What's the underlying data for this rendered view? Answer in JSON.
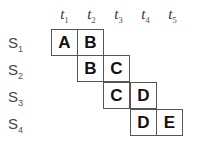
{
  "columns": [
    {
      "base": "t",
      "sub": "1"
    },
    {
      "base": "t",
      "sub": "2"
    },
    {
      "base": "t",
      "sub": "3"
    },
    {
      "base": "t",
      "sub": "4"
    },
    {
      "base": "t",
      "sub": "5"
    }
  ],
  "rows": [
    {
      "base": "S",
      "sub": "1",
      "cells": [
        {
          "col": 0,
          "label": "A"
        },
        {
          "col": 1,
          "label": "B"
        }
      ]
    },
    {
      "base": "S",
      "sub": "2",
      "cells": [
        {
          "col": 1,
          "label": "B"
        },
        {
          "col": 2,
          "label": "C"
        }
      ]
    },
    {
      "base": "S",
      "sub": "3",
      "cells": [
        {
          "col": 2,
          "label": "C"
        },
        {
          "col": 3,
          "label": "D"
        }
      ]
    },
    {
      "base": "S",
      "sub": "4",
      "cells": [
        {
          "col": 3,
          "label": "D"
        },
        {
          "col": 4,
          "label": "E"
        }
      ]
    }
  ]
}
